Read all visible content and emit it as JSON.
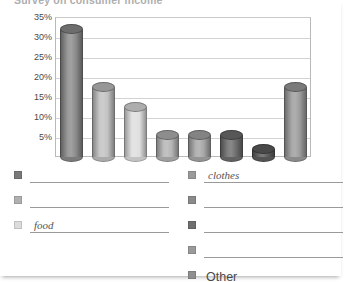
{
  "title": "Survey on consumer income",
  "chart_data": {
    "type": "bar",
    "title": "Survey on consumer income",
    "xlabel": "",
    "ylabel": "",
    "grid": true,
    "legend_position": "bottom",
    "ylim": [
      0,
      35
    ],
    "ytick_labels": [
      "35%",
      "30%",
      "25%",
      "20%",
      "15%",
      "10%",
      "5%"
    ],
    "ytick_values": [
      35,
      30,
      25,
      20,
      15,
      10,
      5
    ],
    "categories": [
      "1",
      "2",
      "3",
      "4",
      "5",
      "6",
      "7",
      "8"
    ],
    "values": [
      32,
      17.5,
      12.5,
      5.5,
      5.5,
      5.5,
      2,
      17.5
    ],
    "bar_colors": [
      "#8c8c8c",
      "#c2c2c2",
      "#dedede",
      "#b5b5b5",
      "#a8a8a8",
      "#6f6f6f",
      "#5e5e5e",
      "#9d9d9d"
    ]
  },
  "legend": {
    "left_column": [
      {
        "swatch": "#7a7a7a",
        "label": "",
        "blank": true
      },
      {
        "swatch": "#b0b0b0",
        "label": "",
        "blank": true
      },
      {
        "swatch": "#dcdcdc",
        "label": "food",
        "blank": true
      }
    ],
    "right_column": [
      {
        "swatch": "#9a9a9a",
        "label": "clothes",
        "blank": true
      },
      {
        "swatch": "#8a8a8a",
        "label": "",
        "blank": true
      },
      {
        "swatch": "#6e6e6e",
        "label": "",
        "blank": true
      },
      {
        "swatch": "#9a9a9a",
        "label": "",
        "blank": true
      },
      {
        "swatch": "#8f8f8f",
        "label": "Other",
        "blank": false
      }
    ]
  }
}
